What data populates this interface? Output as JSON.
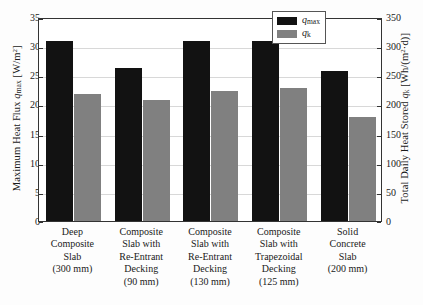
{
  "chart_data": {
    "type": "bar",
    "title": "",
    "categories": [
      "Deep Composite Slab (300 mm)",
      "Composite Slab with Re-Entrant Decking (90 mm)",
      "Composite Slab with Re-Entrant Decking (130 mm)",
      "Composite Slab with Trapezoidal Decking (125 mm)",
      "Solid Concrete Slab (200 mm)"
    ],
    "category_lines": [
      [
        "Deep",
        "Composite",
        "Slab",
        "(300 mm)"
      ],
      [
        "Composite",
        "Slab with",
        "Re-Entrant",
        "Decking",
        "(90 mm)"
      ],
      [
        "Composite",
        "Slab with",
        "Re-Entrant",
        "Decking",
        "(130 mm)"
      ],
      [
        "Composite",
        "Slab with",
        "Trapezoidal",
        "Decking",
        "(125 mm)"
      ],
      [
        "Solid",
        "Concrete",
        "Slab",
        "(200 mm)"
      ]
    ],
    "series": [
      {
        "name": "qmax",
        "label": "q max",
        "color": "#121212",
        "axis": "left",
        "values": [
          30.8,
          26.2,
          30.9,
          30.9,
          25.8
        ]
      },
      {
        "name": "qk",
        "label": "q k",
        "color": "#808080",
        "axis": "right",
        "values": [
          21.8,
          20.7,
          22.3,
          22.8,
          17.9
        ]
      }
    ],
    "xlabel": "",
    "ylabel_left": "Maximum Heat Flux q max [W/m2]",
    "ylabel_right": "Total Daily Heat Stored q k [Wh/(m2·d)]",
    "ylim_left": [
      0,
      35
    ],
    "ylim_right": [
      0,
      350
    ],
    "yticks_left": [
      35,
      30,
      25,
      20,
      15,
      10,
      5,
      0
    ],
    "yticks_right": [
      350,
      300,
      250,
      200,
      150,
      100,
      50,
      0
    ],
    "grid": true,
    "legend_position": "top-right"
  },
  "axes": {
    "left": {
      "title_pre": "Maximum Heat Flux ",
      "title_var": "q",
      "title_sub": "max",
      "title_unit_pre": " [W/m",
      "title_unit_sup": "2",
      "title_unit_post": "]",
      "ticks": [
        "35",
        "30",
        "25",
        "20",
        "15",
        "10",
        "5",
        "0"
      ]
    },
    "right": {
      "title_pre": "Total Daily Heat Stored ",
      "title_var": "q",
      "title_sub": "k",
      "title_unit_pre": " [Wh/(m",
      "title_unit_sup": "2",
      "title_unit_post": "·d)]",
      "ticks": [
        "350",
        "300",
        "250",
        "200",
        "150",
        "100",
        "50",
        "0"
      ]
    }
  },
  "legend": {
    "items": [
      {
        "var": "q",
        "sub": "max",
        "swatch": "qmax"
      },
      {
        "var": "q",
        "sub": "k",
        "swatch": "qk"
      }
    ]
  }
}
